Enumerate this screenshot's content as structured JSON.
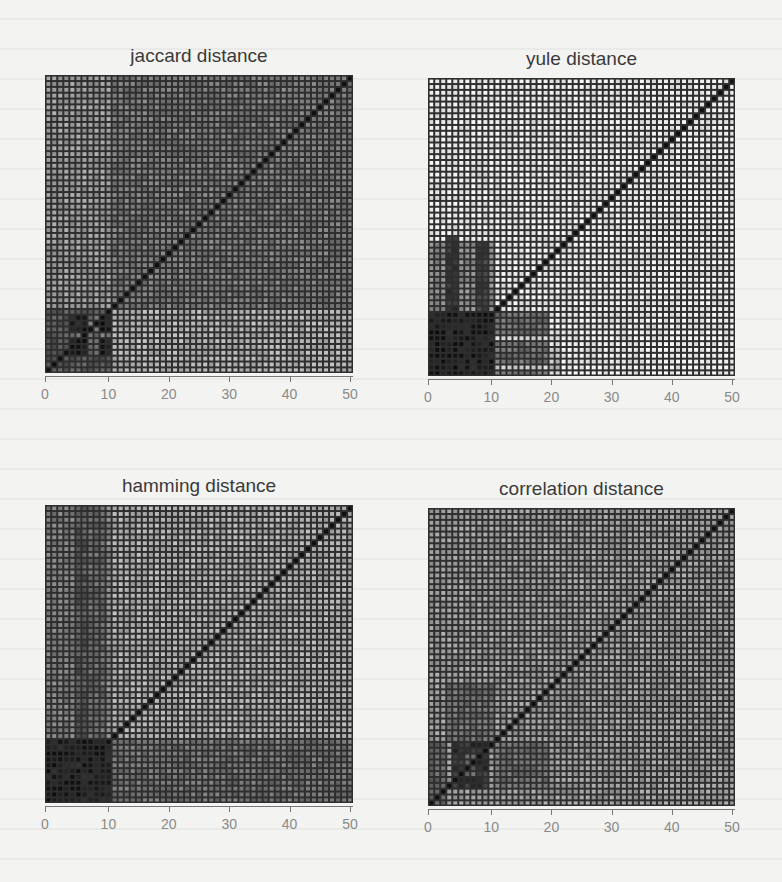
{
  "colors": {
    "background": "#f3f3f1",
    "grid_line": "#2e2e2e",
    "diagonal": "#1a1a1a",
    "title_text": "#3a3a3a",
    "tick_text": "#8a8a8a"
  },
  "chart_data": [
    {
      "type": "heatmap",
      "title": "jaccard distance",
      "n": 51,
      "xlabel": "",
      "ylabel": "",
      "xticks": [
        0,
        10,
        20,
        30,
        40,
        50
      ],
      "xlim": [
        0,
        50
      ],
      "ylim": [
        0,
        50
      ],
      "grid": true,
      "diagonal_value": 0,
      "base_level": 0.55,
      "regions": [
        {
          "x": [
            0,
            10
          ],
          "y": [
            11,
            50
          ],
          "level": 0.62
        },
        {
          "x": [
            11,
            50
          ],
          "y": [
            11,
            50
          ],
          "level": 0.48
        },
        {
          "x": [
            11,
            50
          ],
          "y": [
            0,
            10
          ],
          "level": 0.7
        },
        {
          "x": [
            0,
            10
          ],
          "y": [
            0,
            10
          ],
          "level": 0.35
        },
        {
          "x": [
            4,
            10
          ],
          "y": [
            3,
            9
          ],
          "level": 0.12
        },
        {
          "x": [
            7,
            8
          ],
          "y": [
            3,
            9
          ],
          "level": 0.45
        },
        {
          "x": [
            4,
            10
          ],
          "y": [
            6,
            6
          ],
          "level": 0.45
        }
      ],
      "description": "Pairwise Jaccard distance matrix for 51 items; mid-gray overall, a dark block for items ~4–10, lighter band for rows 0–10 vs columns 11–50."
    },
    {
      "type": "heatmap",
      "title": "yule distance",
      "n": 51,
      "xlabel": "",
      "ylabel": "",
      "xticks": [
        0,
        10,
        20,
        30,
        40,
        50
      ],
      "xlim": [
        0,
        50
      ],
      "ylim": [
        0,
        50
      ],
      "grid": true,
      "diagonal_value": 0,
      "base_level": 0.92,
      "regions": [
        {
          "x": [
            0,
            10
          ],
          "y": [
            11,
            22
          ],
          "level": 0.55
        },
        {
          "x": [
            3,
            4
          ],
          "y": [
            11,
            23
          ],
          "level": 0.2
        },
        {
          "x": [
            8,
            9
          ],
          "y": [
            11,
            22
          ],
          "level": 0.25
        },
        {
          "x": [
            0,
            10
          ],
          "y": [
            0,
            10
          ],
          "level": 0.12
        },
        {
          "x": [
            11,
            19
          ],
          "y": [
            0,
            10
          ],
          "level": 0.45
        },
        {
          "x": [
            11,
            19
          ],
          "y": [
            6,
            6
          ],
          "level": 0.85
        },
        {
          "x": [
            11,
            19
          ],
          "y": [
            1,
            1
          ],
          "level": 0.8
        },
        {
          "x": [
            20,
            21
          ],
          "y": [
            1,
            4
          ],
          "level": 0.75
        }
      ],
      "description": "Yule distance matrix; mostly light (near max distance) with a very dark block for items 0–10 and partial dark bands extending to ~20."
    },
    {
      "type": "heatmap",
      "title": "hamming distance",
      "n": 51,
      "xlabel": "",
      "ylabel": "",
      "xticks": [
        0,
        10,
        20,
        30,
        40,
        50
      ],
      "xlim": [
        0,
        50
      ],
      "ylim": [
        0,
        50
      ],
      "grid": true,
      "diagonal_value": 0,
      "base_level": 0.68,
      "regions": [
        {
          "x": [
            0,
            4
          ],
          "y": [
            11,
            50
          ],
          "level": 0.5
        },
        {
          "x": [
            5,
            6
          ],
          "y": [
            11,
            50
          ],
          "level": 0.35
        },
        {
          "x": [
            7,
            9
          ],
          "y": [
            11,
            50
          ],
          "level": 0.42
        },
        {
          "x": [
            10,
            10
          ],
          "y": [
            11,
            50
          ],
          "level": 0.55
        },
        {
          "x": [
            11,
            50
          ],
          "y": [
            0,
            10
          ],
          "level": 0.45
        },
        {
          "x": [
            0,
            10
          ],
          "y": [
            0,
            10
          ],
          "level": 0.13
        }
      ],
      "description": "Hamming distance matrix; light-gray background, darker vertical bands for columns 0–10, and a dark block for items 0–10."
    },
    {
      "type": "heatmap",
      "title": "correlation distance",
      "n": 51,
      "xlabel": "",
      "ylabel": "",
      "xticks": [
        0,
        10,
        20,
        30,
        40,
        50
      ],
      "xlim": [
        0,
        50
      ],
      "ylim": [
        0,
        50
      ],
      "grid": true,
      "diagonal_value": 0,
      "base_level": 0.62,
      "regions": [
        {
          "x": [
            3,
            10
          ],
          "y": [
            11,
            20
          ],
          "level": 0.45
        },
        {
          "x": [
            4,
            9
          ],
          "y": [
            3,
            10
          ],
          "level": 0.2
        },
        {
          "x": [
            6,
            7
          ],
          "y": [
            5,
            8
          ],
          "level": 0.4
        },
        {
          "x": [
            11,
            19
          ],
          "y": [
            3,
            10
          ],
          "level": 0.45
        },
        {
          "x": [
            0,
            2
          ],
          "y": [
            0,
            10
          ],
          "level": 0.4
        }
      ],
      "description": "Correlation distance matrix; uniform mid-gray with a dark cluster around items 4–10."
    }
  ],
  "panels": [
    {
      "title": "jaccard distance",
      "ticks": [
        "0",
        "10",
        "20",
        "30",
        "40",
        "50"
      ]
    },
    {
      "title": "yule distance",
      "ticks": [
        "0",
        "10",
        "20",
        "30",
        "40",
        "50"
      ]
    },
    {
      "title": "hamming distance",
      "ticks": [
        "0",
        "10",
        "20",
        "30",
        "40",
        "50"
      ]
    },
    {
      "title": "correlation distance",
      "ticks": [
        "0",
        "10",
        "20",
        "30",
        "40",
        "50"
      ]
    }
  ]
}
